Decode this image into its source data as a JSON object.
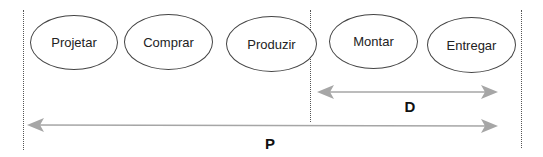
{
  "diagram": {
    "stages": [
      {
        "label": "Projetar"
      },
      {
        "label": "Comprar"
      },
      {
        "label": "Produzir"
      },
      {
        "label": "Montar"
      },
      {
        "label": "Entregar"
      }
    ],
    "arrows": {
      "delivery_lead_time": {
        "label": "D",
        "from_stage": "Montar",
        "to_stage": "Entregar"
      },
      "production_lead_time": {
        "label": "P",
        "from_stage": "Projetar",
        "to_stage": "Entregar"
      }
    },
    "colors": {
      "arrow": "#a6a6a6",
      "ellipse_border": "#444444",
      "divider": "#555555"
    }
  }
}
